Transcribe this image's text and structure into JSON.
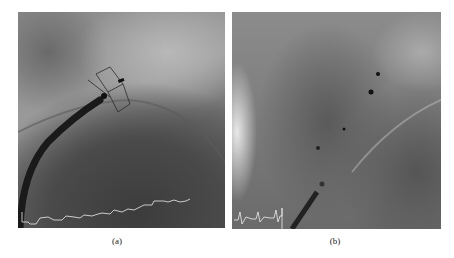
{
  "figure": {
    "panels": [
      {
        "id": "a",
        "label": "(a)",
        "content": "fluoroscopy image with catheter and device, ECG trace overlay"
      },
      {
        "id": "b",
        "label": "(b)",
        "content": "fluoroscopy image with markers and catheter, ECG trace overlay"
      }
    ]
  }
}
